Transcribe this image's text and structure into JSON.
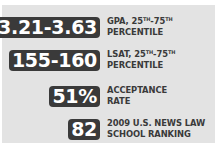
{
  "stats": [
    {
      "value": "3.21-3.63",
      "label_line1_prefix": "GPA, 25",
      "sup1": "TH",
      "dash": "-75",
      "sup2": "TH",
      "label_line2": "PERCENTILE"
    },
    {
      "value": "155-160",
      "label_line1_prefix": "LSAT, 25",
      "sup1": "TH",
      "dash": "-75",
      "sup2": "TH",
      "label_line2": "PERCENTILE"
    },
    {
      "value": "51%",
      "label_line1": "ACCEPTANCE",
      "label_line2": "RATE"
    },
    {
      "value": "82",
      "label_line1": "2009 U.S. NEWS LAW",
      "label_line2": "SCHOOL RANKING"
    }
  ],
  "colors": {
    "badge_bg": "#3a3a3a",
    "panel_bg": "#e3e3e3",
    "text": "#3a3a3a"
  }
}
